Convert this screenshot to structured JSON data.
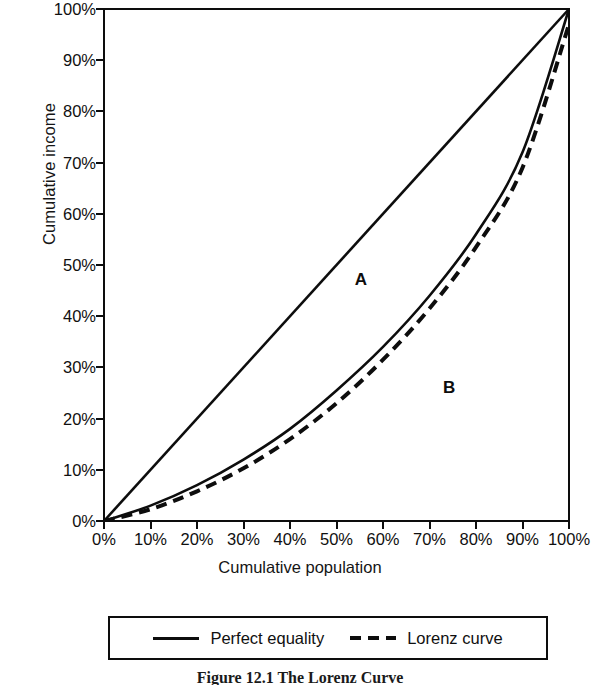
{
  "chart_data": {
    "type": "line",
    "title": "",
    "caption": "Figure 12.1 The Lorenz Curve",
    "xlabel": "Cumulative population",
    "ylabel": "Cumulative income",
    "xlim": [
      0,
      100
    ],
    "ylim": [
      0,
      100
    ],
    "grid": false,
    "legend_position": "bottom",
    "x_tick_labels": [
      "0%",
      "10%",
      "20%",
      "30%",
      "40%",
      "50%",
      "60%",
      "70%",
      "80%",
      "90%",
      "100%"
    ],
    "y_tick_labels": [
      "0%",
      "10%",
      "20%",
      "30%",
      "40%",
      "50%",
      "60%",
      "70%",
      "80%",
      "90%",
      "100%"
    ],
    "x_tick_values": [
      0,
      10,
      20,
      30,
      40,
      50,
      60,
      70,
      80,
      90,
      100
    ],
    "y_tick_values": [
      0,
      10,
      20,
      30,
      40,
      50,
      60,
      70,
      80,
      90,
      100
    ],
    "x": [
      0,
      10,
      20,
      30,
      40,
      50,
      60,
      70,
      80,
      90,
      100
    ],
    "series": [
      {
        "name": "Perfect equality",
        "style": "solid",
        "color": "#0d0d0d",
        "values": [
          0,
          10,
          20,
          30,
          40,
          50,
          60,
          70,
          80,
          90,
          100
        ]
      },
      {
        "name": "Lorenz curve",
        "style": "solid",
        "color": "#0d0d0d",
        "values": [
          0,
          3.0,
          7.0,
          12.0,
          18.0,
          25.5,
          34.0,
          44.0,
          56.0,
          72.0,
          100.0
        ]
      },
      {
        "name": "Lorenz curve",
        "style": "dashed",
        "color": "#0d0d0d",
        "values": [
          0,
          2.3,
          5.8,
          10.3,
          16.0,
          23.0,
          31.5,
          41.5,
          53.5,
          69.0,
          97.0
        ]
      }
    ],
    "annotations": [
      {
        "label": "A",
        "x": 55,
        "y": 47
      },
      {
        "label": "B",
        "x": 74,
        "y": 26
      }
    ],
    "legend": [
      {
        "label": "Perfect equality",
        "style": "solid"
      },
      {
        "label": "Lorenz curve",
        "style": "dashed"
      }
    ]
  }
}
